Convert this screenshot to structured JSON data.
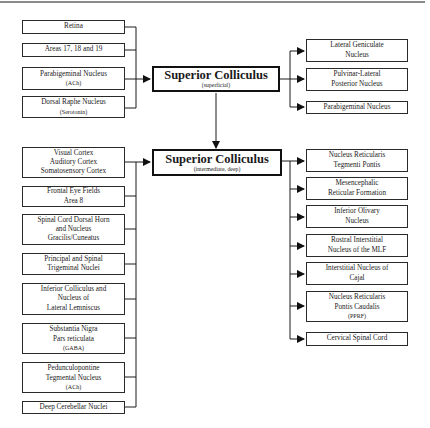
{
  "diagram": {
    "hubs": {
      "superficial": {
        "title": "Superior Colliculus",
        "qualifier": "(superficial)"
      },
      "deep": {
        "title": "Superior Colliculus",
        "qualifier": "(intermediate, deep)"
      }
    },
    "inputs_superficial": [
      {
        "lines": [
          "Retina"
        ]
      },
      {
        "lines": [
          "Areas 17, 18 and 19"
        ]
      },
      {
        "lines": [
          "Parabigeminal Nucleus"
        ],
        "sub": "(ACh)"
      },
      {
        "lines": [
          "Dorsal Raphe Nucleus"
        ],
        "sub": "(Serotonin)"
      }
    ],
    "outputs_superficial": [
      {
        "lines": [
          "Lateral Geniculate",
          "Nucleus"
        ]
      },
      {
        "lines": [
          "Pulvinar-Lateral",
          "Posterior Nucleus"
        ]
      },
      {
        "lines": [
          "Parabigeminal Nucleus"
        ]
      }
    ],
    "inputs_deep": [
      {
        "lines": [
          "Visual Cortex",
          "Auditory Cortex",
          "Somatosensory Cortex"
        ]
      },
      {
        "lines": [
          "Frontal Eye Fields",
          "Area 8"
        ]
      },
      {
        "lines": [
          "Spinal Cord Dorsal Horn",
          "and Nucleus",
          "Gracilis/Cuneatus"
        ]
      },
      {
        "lines": [
          "Principal and Spinal",
          "Trigeminal Nuclei"
        ]
      },
      {
        "lines": [
          "Inferior Colliculus and",
          "Nucleus of",
          "Lateral Lemniscus"
        ]
      },
      {
        "lines": [
          "Substantia Nigra",
          "Pars reticulata"
        ],
        "sub": "(GABA)"
      },
      {
        "lines": [
          "Pedunculopontine",
          "Tegmental Nucleus"
        ],
        "sub": "(ACh)"
      },
      {
        "lines": [
          "Deep Cerebellar Nuclei"
        ]
      }
    ],
    "outputs_deep": [
      {
        "lines": [
          "Nucleus Reticularis",
          "Tegmenti Pontis"
        ]
      },
      {
        "lines": [
          "Mesencephalic",
          "Reticular Formation"
        ]
      },
      {
        "lines": [
          "Inferior Olivary",
          "Nucleus"
        ]
      },
      {
        "lines": [
          "Rostral Interstitial",
          "Nucleus of the MLF"
        ]
      },
      {
        "lines": [
          "Interstitial Nucleus of",
          "Cajal"
        ]
      },
      {
        "lines": [
          "Nucleus Reticularis",
          "Pontis Caudalis"
        ],
        "sub": "(PPRF)"
      },
      {
        "lines": [
          "Cervical Spinal Cord"
        ]
      }
    ],
    "colors": {
      "line": "#1a1a1a",
      "border": "#2a2a2a",
      "background": "#ffffff"
    }
  }
}
